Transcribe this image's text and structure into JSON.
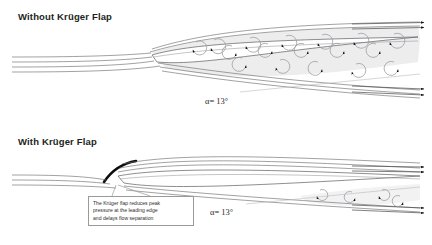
{
  "figure": {
    "background_color": "#ffffff",
    "line_color": "#6f6f73",
    "dark_ink": "#231f20",
    "separation_fill": "#ededee",
    "flap_color": "#0d0d0d",
    "callout_border": "#9a9a9a"
  },
  "panels": {
    "top": {
      "title": "Without Krüger Flap",
      "aoa": {
        "symbol": "α",
        "equals": "=",
        "value": "13°",
        "full": "α= 13°"
      },
      "separation": "large separated region with many vortices",
      "vortex_count": 17
    },
    "bottom": {
      "title": "With Krüger Flap",
      "aoa": {
        "symbol": "α",
        "equals": "=",
        "value": "13°",
        "full": "α= 13°"
      },
      "separation": "small separated region near trailing edge",
      "vortex_count": 4,
      "flap_label": "krüger-flap"
    }
  },
  "callout": {
    "line1": "The Krüger flap reduces peak",
    "line2": "pressure at the leading edge",
    "line3": "and delays flow separation",
    "full": "The Krüger flap reduces peak pressure at the leading edge and delays flow separation"
  }
}
